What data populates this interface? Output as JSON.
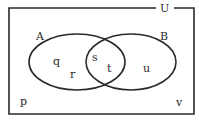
{
  "diagram": {
    "type": "venn",
    "universal_label": "U",
    "sets": [
      {
        "name": "A",
        "elements_only": [
          "q",
          "r"
        ]
      },
      {
        "name": "B",
        "elements_only": [
          "u"
        ]
      }
    ],
    "intersection": [
      "s",
      "t"
    ],
    "outside": [
      "p",
      "v"
    ],
    "labels": {
      "U": "U",
      "A": "A",
      "B": "B",
      "q": "q",
      "r": "r",
      "s": "s",
      "t": "t",
      "u": "u",
      "p": "p",
      "v": "v"
    },
    "colors": {
      "stroke": "#2a2a2a",
      "background": "#ffffff"
    }
  }
}
